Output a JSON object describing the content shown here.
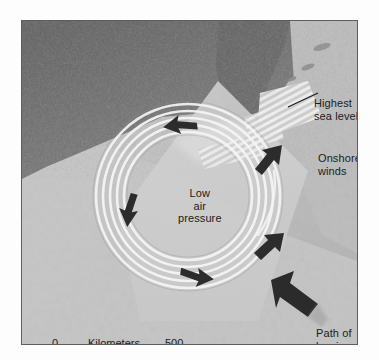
{
  "figure": {
    "kind": "hurricane-landfall-map",
    "frame_border_color": "#5d5d5d",
    "background_color": "#ffffff"
  },
  "map": {
    "base_tone": "#b4b4b4",
    "land_tone": "#6e6e6e",
    "sea_tone": "#c3c3c3",
    "swath_tone": "#cfcfcf",
    "hatch_tone": "#e8e8e8",
    "spiral_color": "#f3f3f3",
    "arrow_color": "#2b2b2b",
    "leader_color": "#1b1b1b"
  },
  "labels": {
    "highest_sea_level": "Highest\nsea level",
    "onshore_winds": "Onshore\nwinds",
    "path_of_hurricane": "Path of\nhurricane",
    "low_air_pressure": "Low\nair\npressure"
  },
  "scale": {
    "zero": "0",
    "units": "Kilometers",
    "max": "500"
  },
  "icons": {
    "wind_arrow": "wind-direction-arrow",
    "storm_track_arrow": "storm-track-arrow",
    "leader_line": "leader-line",
    "hatch_band": "sea-level-hatch-band",
    "scale_rule": "scale-rule"
  }
}
